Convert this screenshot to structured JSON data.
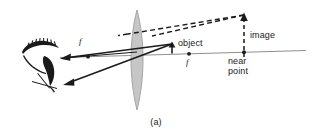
{
  "figure": {
    "caption": "(a)",
    "colors": {
      "ink": "#1a1a1a",
      "axis": "#8a8a8a",
      "lens_fill": "#c9c9c9",
      "lens_stroke": "#9a9a9a",
      "background": "#ffffff"
    },
    "labels": {
      "object": "object",
      "image": "image",
      "focal_left": "f",
      "focal_right": "f",
      "near_line1": "near",
      "near_line2": "point"
    },
    "icons": {
      "eye": "eye-icon",
      "lens": "converging-lens-icon",
      "object_arrow": "object-arrow-icon",
      "image_arrow": "image-arrow-icon",
      "ray_solid": "refracted-ray-icon",
      "ray_dashed": "virtual-ray-icon",
      "focal_point": "focal-point-dot-icon",
      "near_point": "near-point-dot-icon"
    }
  }
}
